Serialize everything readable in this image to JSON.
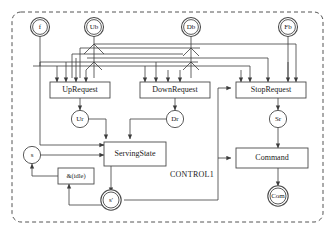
{
  "diagram": {
    "title_region": "CONTROL1",
    "boundary": {
      "style": "dashed",
      "color": "#555555"
    },
    "wire_color": "#3c3c3c",
    "node_fill": "#ffffff",
    "node_stroke": "#4a4a4a",
    "inputs": [
      {
        "id": "f",
        "label": "f",
        "double": true
      },
      {
        "id": "Ub",
        "label": "Ub",
        "double": true
      },
      {
        "id": "Db",
        "label": "Db",
        "double": true
      },
      {
        "id": "Fb",
        "label": "Fb",
        "double": true
      }
    ],
    "processes": [
      {
        "id": "UpRequest",
        "label": "UpRequest"
      },
      {
        "id": "DownRequest",
        "label": "DownRequest"
      },
      {
        "id": "StopRequest",
        "label": "StopRequest"
      },
      {
        "id": "ServingState",
        "label": "ServingState"
      },
      {
        "id": "Command",
        "label": "Command"
      },
      {
        "id": "idle",
        "label": "&(idle)"
      }
    ],
    "signals": [
      {
        "id": "Ur",
        "label": "Ur",
        "double": false
      },
      {
        "id": "Dr",
        "label": "Dr",
        "double": false
      },
      {
        "id": "Sr",
        "label": "Sr",
        "double": false
      },
      {
        "id": "s",
        "label": "s",
        "double": false
      },
      {
        "id": "sprime",
        "label": "s'",
        "double": true
      },
      {
        "id": "Com",
        "label": "Com",
        "double": true
      }
    ]
  }
}
